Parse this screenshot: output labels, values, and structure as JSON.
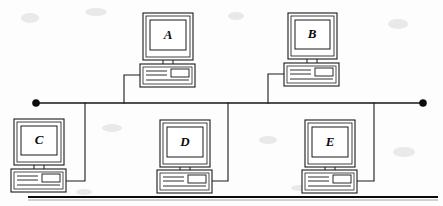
{
  "figure": {
    "kind": "bus-network-topology-diagram",
    "title": "",
    "width": 443,
    "height": 206,
    "background_color": "#fdfdfd",
    "line_color": "#1a1a1a"
  },
  "bus": {
    "label": "",
    "y": 103,
    "x_start": 36,
    "x_end": 423,
    "left_terminator": {
      "name": "left-terminator",
      "cx": 36,
      "cy": 103,
      "r": 3.6,
      "color": "#0d0d0d"
    },
    "right_terminator": {
      "name": "right-terminator",
      "cx": 423,
      "cy": 103,
      "r": 3.6,
      "color": "#0d0d0d"
    }
  },
  "nodes": [
    {
      "id": "A",
      "label": "A",
      "position": "top",
      "monitor": {
        "x": 143,
        "y": 13,
        "w": 50,
        "h": 47
      },
      "base": {
        "x": 140,
        "y": 64,
        "w": 55,
        "h": 23
      },
      "drop": {
        "from_x": 140,
        "from_y": 75,
        "corner_x": 124,
        "to_y": 103
      }
    },
    {
      "id": "B",
      "label": "B",
      "position": "top",
      "monitor": {
        "x": 288,
        "y": 13,
        "w": 49,
        "h": 46
      },
      "base": {
        "x": 284,
        "y": 63,
        "w": 55,
        "h": 23
      },
      "drop": {
        "from_x": 284,
        "from_y": 74,
        "corner_x": 268,
        "to_y": 103
      }
    },
    {
      "id": "C",
      "label": "C",
      "position": "bottom",
      "monitor": {
        "x": 14,
        "y": 119,
        "w": 50,
        "h": 46
      },
      "base": {
        "x": 11,
        "y": 169,
        "w": 55,
        "h": 23
      },
      "drop": {
        "from_x": 66,
        "from_y": 181,
        "corner_x": 85,
        "to_y": 103
      }
    },
    {
      "id": "D",
      "label": "D",
      "position": "bottom",
      "monitor": {
        "x": 160,
        "y": 120,
        "w": 50,
        "h": 47
      },
      "base": {
        "x": 157,
        "y": 170,
        "w": 55,
        "h": 23
      },
      "drop": {
        "from_x": 212,
        "from_y": 181,
        "corner_x": 228,
        "to_y": 103
      }
    },
    {
      "id": "E",
      "label": "E",
      "position": "bottom",
      "monitor": {
        "x": 305,
        "y": 120,
        "w": 50,
        "h": 47
      },
      "base": {
        "x": 302,
        "y": 170,
        "w": 55,
        "h": 23
      },
      "drop": {
        "from_x": 357,
        "from_y": 181,
        "corner_x": 374,
        "to_y": 103
      }
    }
  ],
  "rules": [
    {
      "name": "bottom-rule-thick",
      "x1": 28,
      "y1": 197,
      "x2": 438,
      "y2": 197,
      "weight": 2.1
    },
    {
      "name": "bottom-rule-thin",
      "x1": 28,
      "y1": 200,
      "x2": 438,
      "y2": 200,
      "weight": 0.6
    }
  ]
}
